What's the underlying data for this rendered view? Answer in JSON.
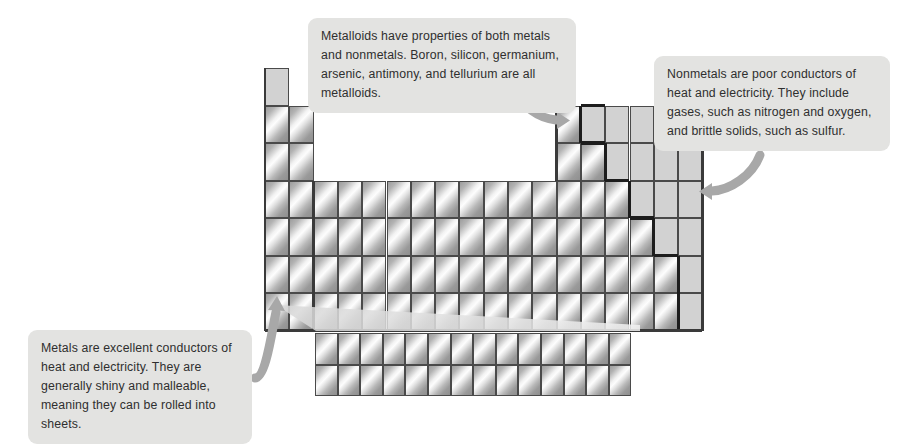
{
  "figure": {
    "background_color": "#ffffff"
  },
  "callouts": [
    {
      "id": "metalloids",
      "name": "callout-metalloids",
      "text": "Metalloids have properties of both metals and nonmetals. Boron, silicon, germanium, arsenic, antimony, and tellurium are all metalloids.",
      "bubble_color": "#e3e3e1",
      "text_color": "#2f2f2f",
      "pointer": "curved-arrow-down-right"
    },
    {
      "id": "nonmetals",
      "name": "callout-nonmetals",
      "text": "Nonmetals are poor conductors of heat and electricity. They include gases, such as nitrogen and oxygen, and brittle solids, such as sulfur.",
      "bubble_color": "#e3e3e1",
      "text_color": "#2f2f2f",
      "pointer": "curved-arrow-down-left"
    },
    {
      "id": "metals",
      "name": "callout-metals",
      "text": "Metals are excellent conductors of heat and electricity. They are generally shiny and malleable, meaning they can be rolled into sheets.",
      "bubble_color": "#e3e3e1",
      "text_color": "#2f2f2f",
      "pointer": "arrow-right"
    }
  ],
  "legend": {
    "metal_fill": "#bdbdbd",
    "metal_description": "shiny gradient cell",
    "nonmetal_fill": "#d2d2d2",
    "nonmetal_description": "flat grey cell",
    "staircase_color": "#1d1d1d",
    "cell_border": "#4a4a4a"
  },
  "chart_data": {
    "type": "table",
    "columns": 18,
    "main_rows": 7,
    "inner_block_rows": 2,
    "inner_block_columns": 14,
    "geometry": {
      "origin_x": 265,
      "origin_y": 68,
      "cell_width": 24.3,
      "cell_height": 37.5,
      "row1_height": 37,
      "inner_origin_x": 315,
      "inner_origin_y": 333,
      "inner_cell_width": 22.6,
      "inner_cell_height": 31.5
    },
    "row_occupancy": [
      {
        "row": 1,
        "filled_columns": [
          1,
          18
        ]
      },
      {
        "row": 2,
        "filled_columns": [
          1,
          2,
          13,
          14,
          15,
          16,
          17,
          18
        ]
      },
      {
        "row": 3,
        "filled_columns": [
          1,
          2,
          13,
          14,
          15,
          16,
          17,
          18
        ]
      },
      {
        "row": 4,
        "filled_columns": [
          1,
          2,
          3,
          4,
          5,
          6,
          7,
          8,
          9,
          10,
          11,
          12,
          13,
          14,
          15,
          16,
          17,
          18
        ]
      },
      {
        "row": 5,
        "filled_columns": [
          1,
          2,
          3,
          4,
          5,
          6,
          7,
          8,
          9,
          10,
          11,
          12,
          13,
          14,
          15,
          16,
          17,
          18
        ]
      },
      {
        "row": 6,
        "filled_columns": [
          1,
          2,
          3,
          4,
          5,
          6,
          7,
          8,
          9,
          10,
          11,
          12,
          13,
          14,
          15,
          16,
          17,
          18
        ]
      },
      {
        "row": 7,
        "filled_columns": [
          1,
          2,
          3,
          4,
          5,
          6,
          7,
          8,
          9,
          10,
          11,
          12,
          13,
          14,
          15,
          16,
          17,
          18
        ]
      }
    ],
    "nonmetal_cells": [
      {
        "row": 1,
        "col": 1
      },
      {
        "row": 1,
        "col": 18
      },
      {
        "row": 2,
        "col": 14
      },
      {
        "row": 2,
        "col": 15
      },
      {
        "row": 2,
        "col": 16
      },
      {
        "row": 2,
        "col": 17
      },
      {
        "row": 2,
        "col": 18
      },
      {
        "row": 3,
        "col": 15
      },
      {
        "row": 3,
        "col": 16
      },
      {
        "row": 3,
        "col": 17
      },
      {
        "row": 3,
        "col": 18
      },
      {
        "row": 4,
        "col": 16
      },
      {
        "row": 4,
        "col": 17
      },
      {
        "row": 4,
        "col": 18
      },
      {
        "row": 5,
        "col": 17
      },
      {
        "row": 5,
        "col": 18
      },
      {
        "row": 6,
        "col": 18
      },
      {
        "row": 7,
        "col": 18
      }
    ],
    "staircase_description": "Heavy zig-zag boundary descending from between groups 13/14 in period 2 to between groups 17/18 in period 7, separating metals (left) from nonmetals (right)."
  }
}
